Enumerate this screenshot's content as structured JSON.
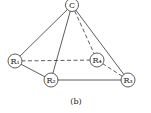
{
  "diagram": {
    "caption": "(b)",
    "nodes": [
      {
        "id": "C",
        "label": "C",
        "x": 72,
        "y": 5
      },
      {
        "id": "R1",
        "label": "R₁",
        "x": 15,
        "y": 61
      },
      {
        "id": "R2",
        "label": "R₂",
        "x": 51,
        "y": 80
      },
      {
        "id": "R3",
        "label": "R₃",
        "x": 128,
        "y": 80
      },
      {
        "id": "R4",
        "label": "R₄",
        "x": 97,
        "y": 60
      }
    ],
    "edges": [
      {
        "from": "C",
        "to": "R1",
        "style": "solid"
      },
      {
        "from": "C",
        "to": "R2",
        "style": "solid"
      },
      {
        "from": "C",
        "to": "R3",
        "style": "solid"
      },
      {
        "from": "C",
        "to": "R4",
        "style": "dashed"
      },
      {
        "from": "R1",
        "to": "R4",
        "style": "dashed"
      },
      {
        "from": "R1",
        "to": "R2",
        "style": "solid"
      },
      {
        "from": "R2",
        "to": "R3",
        "style": "solid"
      },
      {
        "from": "R4",
        "to": "R3",
        "style": "dashed"
      }
    ]
  }
}
